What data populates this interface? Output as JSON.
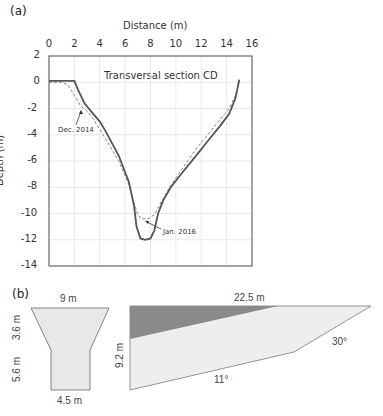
{
  "panel_a": {
    "label": "(a)",
    "x_axis_title": "Distance (m)",
    "y_axis_title": "Depth (m)",
    "plot_title": "Transversal section CD",
    "x_ticks": [
      "0",
      "2",
      "4",
      "6",
      "8",
      "10",
      "12",
      "14",
      "16"
    ],
    "y_ticks": [
      "2",
      "0",
      "-2",
      "-4",
      "-6",
      "-8",
      "-10",
      "-12",
      "-14"
    ],
    "annotations": {
      "dec2014": "Dec. 2014",
      "jan2016": "Jan. 2016"
    }
  },
  "panel_b": {
    "label": "(b)",
    "left_shape": {
      "top_width": "9 m",
      "upper_height": "3.6 m",
      "lower_height": "5.6 m",
      "bottom_width": "4.5 m"
    },
    "right_shape": {
      "top_length": "22.5 m",
      "height": "9.2 m",
      "bottom_angle": "11°",
      "side_angle": "30°"
    }
  },
  "chart_data": {
    "type": "line",
    "title": "Transversal section CD",
    "xlabel": "Distance (m)",
    "ylabel": "Depth (m)",
    "xlim": [
      0,
      16
    ],
    "ylim": [
      -14,
      2
    ],
    "x_ticks": [
      0,
      2,
      4,
      6,
      8,
      10,
      12,
      14,
      16
    ],
    "y_ticks": [
      2,
      0,
      -2,
      -4,
      -6,
      -8,
      -10,
      -12,
      -14
    ],
    "grid": true,
    "x_axis_position": "top",
    "series": [
      {
        "name": "Dec. 2014",
        "style": "dashed",
        "x": [
          0,
          1.0,
          1.5,
          2.0,
          2.5,
          3.0,
          3.5,
          4.5,
          5.5,
          6.3,
          6.7,
          7.0,
          7.3,
          7.8,
          8.3,
          8.8,
          9.5,
          10.5,
          11.5,
          12.5,
          13.5,
          14.2,
          14.7,
          15.0
        ],
        "y": [
          0,
          0,
          -0.2,
          -1.0,
          -1.8,
          -2.2,
          -2.8,
          -4.4,
          -6.0,
          -7.8,
          -9.2,
          -10.1,
          -10.4,
          -10.4,
          -10.1,
          -9.2,
          -8.0,
          -6.6,
          -5.2,
          -4.0,
          -2.8,
          -2.0,
          -1.0,
          0.1
        ]
      },
      {
        "name": "Jan. 2016",
        "style": "solid",
        "x": [
          0,
          1.0,
          1.5,
          2.0,
          2.3,
          2.8,
          3.3,
          4.0,
          4.5,
          5.5,
          6.3,
          6.7,
          6.9,
          7.2,
          7.6,
          8.0,
          8.3,
          8.6,
          9.0,
          9.6,
          10.5,
          11.5,
          12.5,
          13.5,
          14.2,
          14.7,
          15.0
        ],
        "y": [
          0.1,
          0.1,
          0.1,
          0.1,
          -0.6,
          -1.6,
          -2.2,
          -3.0,
          -3.8,
          -5.6,
          -7.6,
          -9.4,
          -11.0,
          -11.9,
          -12.0,
          -11.9,
          -11.3,
          -10.0,
          -9.0,
          -8.0,
          -6.9,
          -5.7,
          -4.5,
          -3.3,
          -2.4,
          -1.2,
          0.2
        ]
      }
    ]
  }
}
